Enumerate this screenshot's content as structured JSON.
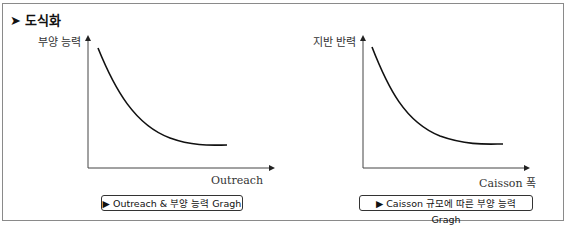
{
  "title": "➤ 도식화",
  "diagrams": [
    {
      "y_label": "부양 능력",
      "x_label": "Outreach",
      "caption": "▶ Outreach & 부양 능력 Gragh",
      "curve": "decreasing-exponential"
    },
    {
      "y_label": "지반 반력",
      "x_label": "Caisson 폭",
      "caption": "▶ Caisson 규모에 따른 부양 능력 Gragh",
      "curve": "decreasing-exponential"
    }
  ],
  "colors": {
    "border": "#8a8a8a",
    "line": "#111111"
  }
}
